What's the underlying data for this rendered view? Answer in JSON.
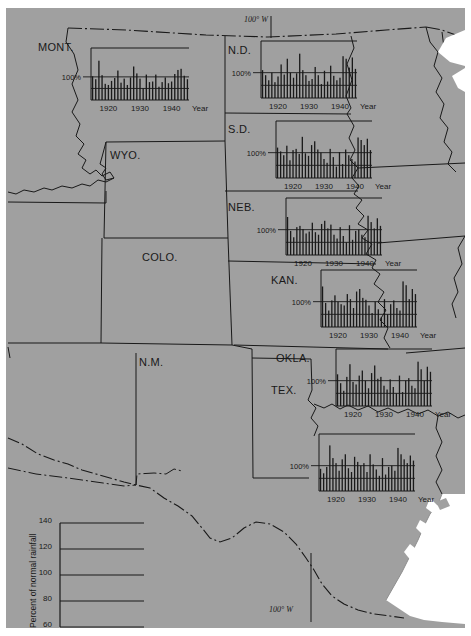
{
  "figure": {
    "background_color": "#a0a0a0",
    "ink_color": "#191919",
    "water_color": "#ffffff",
    "coordinate_labels": [
      {
        "text": "100° W",
        "position": "top"
      },
      {
        "text": "100° W",
        "position": "bottom"
      }
    ]
  },
  "states": [
    {
      "code": "MONT.",
      "label": "MONT."
    },
    {
      "code": "N.D.",
      "label": "N.D."
    },
    {
      "code": "S.D.",
      "label": "S.D."
    },
    {
      "code": "WYO.",
      "label": "WYO."
    },
    {
      "code": "NEB.",
      "label": "NEB."
    },
    {
      "code": "COLO.",
      "label": "COLO."
    },
    {
      "code": "KAN.",
      "label": "KAN."
    },
    {
      "code": "N.M.",
      "label": "N.M."
    },
    {
      "code": "OKLA.",
      "label": "OKLA."
    },
    {
      "code": "TEX.",
      "label": "TEX."
    }
  ],
  "legend": {
    "axis_title": "Percent of normal rainfall",
    "ticks": [
      "140",
      "120",
      "100",
      "80",
      "60"
    ],
    "tick_values": [
      140,
      120,
      100,
      80,
      60
    ]
  },
  "chart_common": {
    "pct_label": "100%",
    "year_word": "Year",
    "x_tick_labels": [
      "1920",
      "1930",
      "1940"
    ],
    "ylabel": "Percent of normal rainfall",
    "xlabel": "Year"
  },
  "chart_data": [
    {
      "type": "bar",
      "title": "MONT.",
      "state": "MONT.",
      "xlabel": "Year",
      "ylabel": "Percent of normal rainfall",
      "ylim": [
        60,
        150
      ],
      "baseline": 100,
      "grid": false,
      "x_tick_labels": [
        "1920",
        "1930",
        "1940"
      ],
      "x": [
        1915,
        1916,
        1917,
        1918,
        1919,
        1920,
        1921,
        1922,
        1923,
        1924,
        1925,
        1926,
        1927,
        1928,
        1929,
        1930,
        1931,
        1932,
        1933,
        1934,
        1935,
        1936,
        1937,
        1938,
        1939,
        1940,
        1941,
        1942,
        1943,
        1944,
        1945
      ],
      "values": [
        101,
        96,
        128,
        103,
        88,
        86,
        93,
        98,
        111,
        90,
        97,
        86,
        99,
        118,
        106,
        97,
        80,
        104,
        91,
        92,
        104,
        83,
        91,
        99,
        89,
        92,
        105,
        112,
        114,
        102,
        96
      ]
    },
    {
      "type": "bar",
      "title": "N.D.",
      "state": "N.D.",
      "xlabel": "Year",
      "ylabel": "Percent of normal rainfall",
      "ylim": [
        60,
        150
      ],
      "baseline": 100,
      "grid": false,
      "x_tick_labels": [
        "1920",
        "1930",
        "1940"
      ],
      "x": [
        1915,
        1916,
        1917,
        1918,
        1919,
        1920,
        1921,
        1922,
        1923,
        1924,
        1925,
        1926,
        1927,
        1928,
        1929,
        1930,
        1931,
        1932,
        1933,
        1934,
        1935,
        1936,
        1937,
        1938,
        1939,
        1940,
        1941,
        1942,
        1943,
        1944,
        1945
      ],
      "values": [
        104,
        96,
        88,
        100,
        85,
        94,
        113,
        97,
        122,
        100,
        92,
        99,
        130,
        104,
        96,
        87,
        90,
        109,
        96,
        82,
        103,
        86,
        111,
        95,
        88,
        92,
        126,
        122,
        108,
        124,
        106
      ]
    },
    {
      "type": "bar",
      "title": "S.D.",
      "state": "S.D.",
      "xlabel": "Year",
      "ylabel": "Percent of normal rainfall",
      "ylim": [
        60,
        150
      ],
      "baseline": 100,
      "grid": false,
      "x_tick_labels": [
        "1920",
        "1930",
        "1940"
      ],
      "x": [
        1915,
        1916,
        1917,
        1918,
        1919,
        1920,
        1921,
        1922,
        1923,
        1924,
        1925,
        1926,
        1927,
        1928,
        1929,
        1930,
        1931,
        1932,
        1933,
        1934,
        1935,
        1936,
        1937,
        1938,
        1939,
        1940,
        1941,
        1942,
        1943,
        1944,
        1945
      ],
      "values": [
        108,
        102,
        96,
        111,
        88,
        104,
        106,
        98,
        125,
        99,
        95,
        112,
        118,
        105,
        100,
        90,
        84,
        106,
        93,
        78,
        101,
        82,
        105,
        96,
        90,
        86,
        124,
        120,
        112,
        122,
        104
      ]
    },
    {
      "type": "bar",
      "title": "NEB.",
      "state": "NEB.",
      "xlabel": "Year",
      "ylabel": "Percent of normal rainfall",
      "ylim": [
        60,
        150
      ],
      "baseline": 100,
      "grid": false,
      "x_tick_labels": [
        "1920",
        "1930",
        "1940"
      ],
      "x": [
        1915,
        1916,
        1917,
        1918,
        1919,
        1920,
        1921,
        1922,
        1923,
        1924,
        1925,
        1926,
        1927,
        1928,
        1929,
        1930,
        1931,
        1932,
        1933,
        1934,
        1935,
        1936,
        1937,
        1938,
        1939,
        1940,
        1941,
        1942,
        1943,
        1944,
        1945
      ],
      "values": [
        120,
        98,
        88,
        104,
        106,
        101,
        94,
        97,
        111,
        96,
        92,
        109,
        114,
        102,
        108,
        92,
        86,
        104,
        90,
        80,
        107,
        84,
        98,
        100,
        92,
        88,
        122,
        112,
        102,
        118,
        106
      ]
    },
    {
      "type": "bar",
      "title": "KAN.",
      "state": "KAN.",
      "xlabel": "Year",
      "ylabel": "Percent of normal rainfall",
      "ylim": [
        60,
        150
      ],
      "baseline": 100,
      "grid": false,
      "x_tick_labels": [
        "1920",
        "1930",
        "1940"
      ],
      "x": [
        1915,
        1916,
        1917,
        1918,
        1919,
        1920,
        1921,
        1922,
        1923,
        1924,
        1925,
        1926,
        1927,
        1928,
        1929,
        1930,
        1931,
        1932,
        1933,
        1934,
        1935,
        1936,
        1937,
        1938,
        1939,
        1940,
        1941,
        1942,
        1943,
        1944,
        1945
      ],
      "values": [
        124,
        98,
        86,
        102,
        110,
        100,
        96,
        94,
        112,
        104,
        90,
        116,
        120,
        106,
        103,
        94,
        82,
        100,
        88,
        76,
        104,
        80,
        96,
        102,
        90,
        86,
        132,
        126,
        104,
        120,
        112
      ]
    },
    {
      "type": "bar",
      "title": "OKLA.",
      "state": "OKLA.",
      "xlabel": "Year",
      "ylabel": "Percent of normal rainfall",
      "ylim": [
        60,
        150
      ],
      "baseline": 100,
      "grid": false,
      "x_tick_labels": [
        "1920",
        "1930",
        "1940"
      ],
      "x": [
        1915,
        1916,
        1917,
        1918,
        1919,
        1920,
        1921,
        1922,
        1923,
        1924,
        1925,
        1926,
        1927,
        1928,
        1929,
        1930,
        1931,
        1932,
        1933,
        1934,
        1935,
        1936,
        1937,
        1938,
        1939,
        1940,
        1941,
        1942,
        1943,
        1944,
        1945
      ],
      "values": [
        110,
        96,
        84,
        106,
        126,
        98,
        94,
        108,
        116,
        100,
        88,
        112,
        124,
        103,
        106,
        92,
        86,
        102,
        90,
        80,
        108,
        82,
        100,
        104,
        92,
        88,
        130,
        118,
        100,
        122,
        114
      ]
    },
    {
      "type": "bar",
      "title": "TEX.",
      "state": "TEX.",
      "xlabel": "Year",
      "ylabel": "Percent of normal rainfall",
      "ylim": [
        60,
        150
      ],
      "baseline": 100,
      "grid": false,
      "x_tick_labels": [
        "1920",
        "1930",
        "1940"
      ],
      "x": [
        1915,
        1916,
        1917,
        1918,
        1919,
        1920,
        1921,
        1922,
        1923,
        1924,
        1925,
        1926,
        1927,
        1928,
        1929,
        1930,
        1931,
        1932,
        1933,
        1934,
        1935,
        1936,
        1937,
        1938,
        1939,
        1940,
        1941,
        1942,
        1943,
        1944,
        1945
      ],
      "values": [
        95,
        88,
        98,
        132,
        112,
        104,
        92,
        110,
        118,
        96,
        90,
        114,
        106,
        100,
        104,
        90,
        118,
        102,
        94,
        84,
        112,
        86,
        98,
        100,
        92,
        128,
        118,
        110,
        104,
        116,
        108
      ]
    }
  ],
  "chart_placements": [
    {
      "state": "MONT.",
      "left": 85,
      "top": 40,
      "w": 98,
      "h": 52,
      "pct_x": 60,
      "pct_y": 62,
      "pct_anchor": 3
    },
    {
      "state": "N.D.",
      "left": 255,
      "top": 33,
      "w": 96,
      "h": 57,
      "pct_x": 230,
      "pct_y": 56,
      "pct_anchor": 3
    },
    {
      "state": "S.D.",
      "left": 270,
      "top": 113,
      "w": 96,
      "h": 57,
      "pct_x": 245,
      "pct_y": 138,
      "pct_anchor": 3
    },
    {
      "state": "NEB.",
      "left": 280,
      "top": 190,
      "w": 96,
      "h": 57,
      "pct_x": 255,
      "pct_y": 212,
      "pct_anchor": 3
    },
    {
      "state": "KAN.",
      "left": 315,
      "top": 262,
      "w": 96,
      "h": 57,
      "pct_x": 290,
      "pct_y": 285,
      "pct_anchor": 3
    },
    {
      "state": "OKLA.",
      "left": 330,
      "top": 341,
      "w": 96,
      "h": 57,
      "pct_x": 305,
      "pct_y": 361,
      "pct_anchor": 3
    },
    {
      "state": "TEX.",
      "left": 313,
      "top": 426,
      "w": 96,
      "h": 57,
      "pct_x": 288,
      "pct_y": 456,
      "pct_anchor": 3
    }
  ],
  "state_label_positions": [
    {
      "state": "MONT.",
      "left": 32,
      "top": 33
    },
    {
      "state": "N.D.",
      "left": 222,
      "top": 36
    },
    {
      "state": "S.D.",
      "left": 222,
      "top": 115
    },
    {
      "state": "WYO.",
      "left": 104,
      "top": 141
    },
    {
      "state": "NEB.",
      "left": 222,
      "top": 193
    },
    {
      "state": "COLO.",
      "left": 136,
      "top": 243
    },
    {
      "state": "KAN.",
      "left": 265,
      "top": 266
    },
    {
      "state": "N.M.",
      "left": 133,
      "top": 348
    },
    {
      "state": "OKLA.",
      "left": 270,
      "top": 344
    },
    {
      "state": "TEX.",
      "left": 265,
      "top": 376
    }
  ],
  "legend_box": {
    "left": 50,
    "top": 513,
    "w": 94,
    "h": 108
  }
}
